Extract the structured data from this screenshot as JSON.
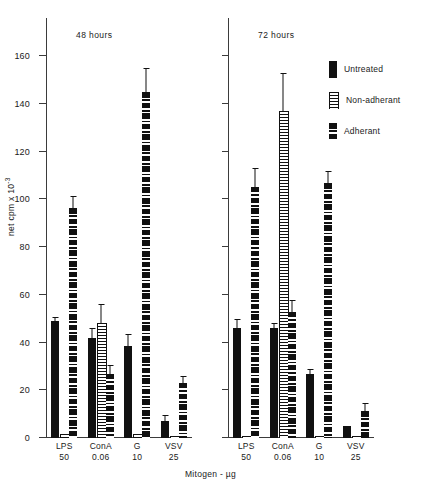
{
  "chart_data": {
    "type": "bar",
    "title": "",
    "xlabel": "Mitogen - µg",
    "ylabel": "net cpm x 10⁻³",
    "ylim": [
      0,
      168
    ],
    "yticks": [
      0,
      20,
      40,
      60,
      80,
      100,
      120,
      140,
      160
    ],
    "ytick_labels": [
      "0",
      "20",
      "40",
      "60",
      "80",
      "100",
      "120",
      "140",
      "160"
    ],
    "grid": false,
    "legend_position": "right",
    "categories": [
      "LPS",
      "ConA",
      "G",
      "VSV"
    ],
    "category_doses": [
      "50",
      "0.06",
      "10",
      "25"
    ],
    "panels": [
      {
        "label": "48 hours",
        "series": [
          {
            "name": "Untreated",
            "fill": "solid",
            "values": [
              49,
              42,
              38.5,
              7
            ],
            "errors": [
              1.5,
              4,
              5,
              2.5
            ]
          },
          {
            "name": "Non-adherant",
            "fill": "fine-stripes",
            "values": [
              1.5,
              48,
              1.5,
              1
            ],
            "errors": [
              0,
              8,
              0,
              0
            ]
          },
          {
            "name": "Adherant",
            "fill": "dash-blocks",
            "values": [
              96.5,
              27,
              145,
              23
            ],
            "errors": [
              5,
              3.5,
              10,
              3
            ]
          }
        ]
      },
      {
        "label": "72 hours",
        "series": [
          {
            "name": "Untreated",
            "fill": "solid",
            "values": [
              46,
              46,
              27,
              5
            ],
            "errors": [
              4,
              2,
              2,
              0
            ]
          },
          {
            "name": "Non-adherant",
            "fill": "fine-stripes",
            "values": [
              1,
              137,
              1,
              1
            ],
            "errors": [
              0,
              16,
              0,
              0
            ]
          },
          {
            "name": "Adherant",
            "fill": "dash-blocks",
            "values": [
              105,
              53,
              107,
              11.5
            ],
            "errors": [
              8,
              5,
              5,
              3
            ]
          }
        ]
      }
    ]
  },
  "yaxis": {
    "title": "net cpm x 10",
    "title_exponent": "-3"
  },
  "xaxis": {
    "title": "Mitogen - µg",
    "ticks": [
      {
        "name": "LPS",
        "dose": "50"
      },
      {
        "name": "ConA",
        "dose": "0.06"
      },
      {
        "name": "G",
        "dose": "10"
      },
      {
        "name": "VSV",
        "dose": "25"
      }
    ]
  },
  "panels": {
    "left_caption": "48 hours",
    "right_caption": "72 hours"
  },
  "legend": {
    "items": [
      {
        "label": "Untreated",
        "pattern": "solid"
      },
      {
        "label": "Non-adherant",
        "pattern": "fine-stripes"
      },
      {
        "label": "Adherant",
        "pattern": "dash-blocks"
      }
    ]
  }
}
